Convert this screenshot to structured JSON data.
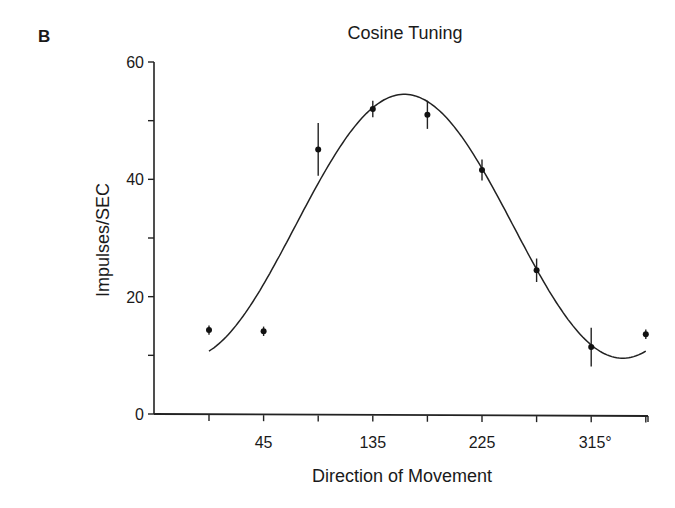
{
  "panel_label": "B",
  "chart_data": {
    "type": "scatter",
    "title": "Cosine Tuning",
    "xlabel": "Direction of Movement",
    "ylabel": "Impulses/SEC",
    "x_tick_labels": [
      {
        "value": 45,
        "label": "45"
      },
      {
        "value": 135,
        "label": "135"
      },
      {
        "value": 225,
        "label": "225"
      },
      {
        "value": 315,
        "label": "315°"
      }
    ],
    "x_ticks": [
      0,
      45,
      90,
      135,
      180,
      225,
      270,
      315,
      360
    ],
    "y_tick_labels": [
      {
        "value": 0,
        "label": "0"
      },
      {
        "value": 20,
        "label": "20"
      },
      {
        "value": 40,
        "label": "40"
      },
      {
        "value": 60,
        "label": "60"
      }
    ],
    "y_ticks": [
      0,
      10,
      20,
      30,
      40,
      50,
      60
    ],
    "xlim": [
      -45,
      368
    ],
    "ylim": [
      0,
      60
    ],
    "grid": false,
    "legend": null,
    "series": [
      {
        "name": "Mean firing rate (± error)",
        "style": "points-with-errorbars",
        "x": [
          0,
          45,
          90,
          135,
          180,
          225,
          270,
          315,
          360
        ],
        "y": [
          14.3,
          14.1,
          45.1,
          52.0,
          51.0,
          41.6,
          24.5,
          11.4,
          13.6
        ],
        "error": [
          0.8,
          0.8,
          4.5,
          1.4,
          2.4,
          1.8,
          2.0,
          3.3,
          0.8
        ]
      },
      {
        "name": "Cosine fit",
        "style": "line",
        "equation": "y = 32 + 22.5 * cos(theta - 161°)",
        "baseline": 32,
        "amplitude": 22.5,
        "preferred_direction_deg": 161,
        "x_range": [
          0,
          360
        ]
      }
    ]
  }
}
